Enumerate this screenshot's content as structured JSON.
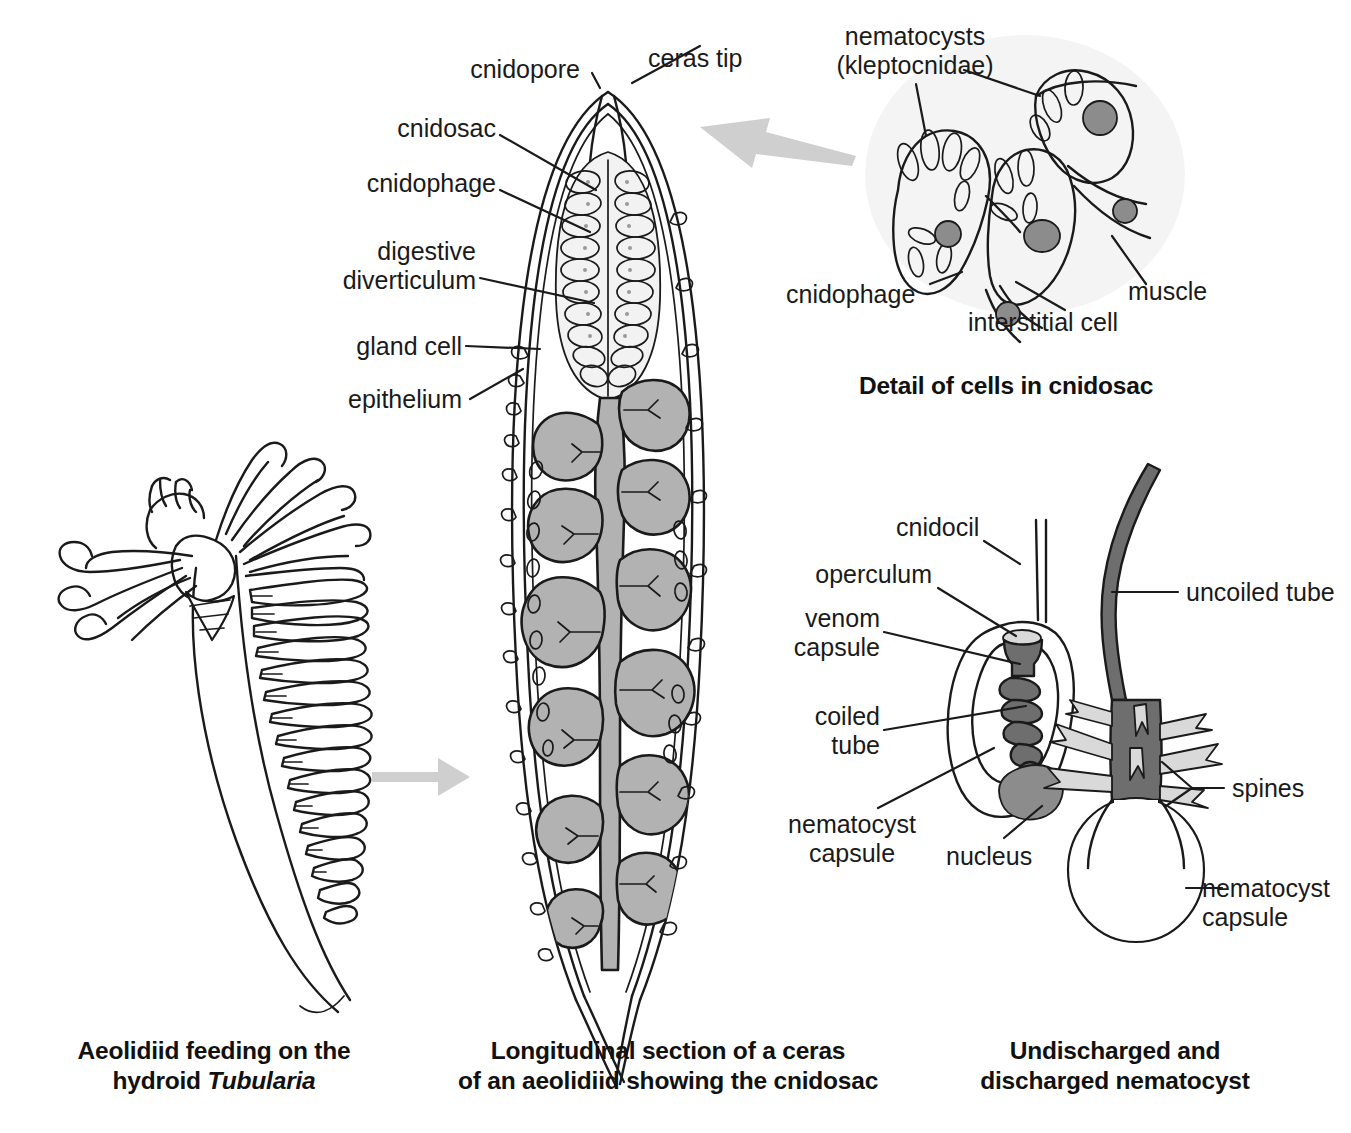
{
  "figure": {
    "title_semantic": "aeolid-nudibranch-cnidosac-nematocyst-diagram",
    "background": "#ffffff",
    "ink": "#1a1a1a",
    "colors": {
      "line": "#1a1a1a",
      "diverticulum_fill": "#b2b2b2",
      "cnidosac_fill": "#f2f2f2",
      "nucleus_fill": "#8c8c8c",
      "tube_fill": "#6e6e6e",
      "spine_fill": "#d4d4d4",
      "panel_wash": "#f4f4f4",
      "arrow_fill": "#cfcfcf"
    }
  },
  "panels": {
    "left": {
      "name": "aeolidiid-feeding-on-hydroid",
      "caption_line1": "Aeolidiid feeding on the",
      "caption_line2_pre": "hydroid ",
      "caption_line2_italic": "Tubularia"
    },
    "center": {
      "name": "longitudinal-section-of-ceras",
      "caption_line1": "Longitudinal section of a ceras",
      "caption_line2": "of an aeolidiid showing the cnidosac",
      "labels": [
        {
          "id": "cnidopore",
          "text": "cnidopore"
        },
        {
          "id": "ceras-tip",
          "text": "ceras tip"
        },
        {
          "id": "cnidosac",
          "text": "cnidosac"
        },
        {
          "id": "cnidophage",
          "text": "cnidophage"
        },
        {
          "id": "digestive-diverticulum",
          "text": "digestive\ndiverticulum"
        },
        {
          "id": "gland-cell",
          "text": "gland cell"
        },
        {
          "id": "epithelium",
          "text": "epithelium"
        }
      ]
    },
    "top_right": {
      "name": "detail-of-cells-in-cnidosac",
      "title": "Detail of cells in cnidosac",
      "labels": [
        {
          "id": "nematocysts",
          "text": "nematocysts\n(kleptocnidae)"
        },
        {
          "id": "cnidophage",
          "text": "cnidophage"
        },
        {
          "id": "interstitial-cell",
          "text": "interstitial cell"
        },
        {
          "id": "muscle",
          "text": "muscle"
        }
      ]
    },
    "bottom_right": {
      "name": "undischarged-and-discharged-nematocyst",
      "caption_line1": "Undischarged and",
      "caption_line2": "discharged nematocyst",
      "labels": [
        {
          "id": "cnidocil",
          "text": "cnidocil"
        },
        {
          "id": "operculum",
          "text": "operculum"
        },
        {
          "id": "venom-capsule",
          "text": "venom\ncapsule"
        },
        {
          "id": "coiled-tube",
          "text": "coiled\ntube"
        },
        {
          "id": "nematocyst-capsule-left",
          "text": "nematocyst\ncapsule"
        },
        {
          "id": "nucleus",
          "text": "nucleus"
        },
        {
          "id": "uncoiled-tube",
          "text": "uncoiled tube"
        },
        {
          "id": "spines",
          "text": "spines"
        },
        {
          "id": "nematocyst-capsule-right",
          "text": "nematocyst\ncapsule"
        }
      ]
    }
  },
  "arrows": [
    {
      "id": "arrow-left-to-ceras",
      "direction": "right"
    },
    {
      "id": "arrow-cnidosac-to-ceras",
      "direction": "left"
    }
  ]
}
